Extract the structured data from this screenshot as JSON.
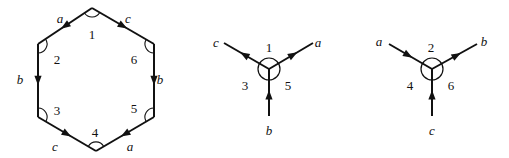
{
  "hexagon": {
    "vertices": [
      {
        "x": 92,
        "y": 8
      },
      {
        "x": 154,
        "y": 44
      },
      {
        "x": 154,
        "y": 117
      },
      {
        "x": 96,
        "y": 151
      },
      {
        "x": 38,
        "y": 117
      },
      {
        "x": 38,
        "y": 44
      }
    ],
    "edges": [
      {
        "from": 0,
        "to": 5,
        "label": "a",
        "label_x": 60,
        "label_y": 20,
        "arrow_t": 0.5
      },
      {
        "from": 0,
        "to": 1,
        "label": "c",
        "label_x": 128,
        "label_y": 20,
        "arrow_t": 0.5
      },
      {
        "from": 5,
        "to": 4,
        "label": "b",
        "label_x": 20,
        "label_y": 81,
        "arrow_t": 0.5
      },
      {
        "from": 1,
        "to": 2,
        "label": "b",
        "label_x": 160,
        "label_y": 81,
        "arrow_t": 0.5
      },
      {
        "from": 4,
        "to": 3,
        "label": "c",
        "label_x": 55,
        "label_y": 148,
        "arrow_t": 0.5
      },
      {
        "from": 2,
        "to": 3,
        "label": "a",
        "label_x": 130,
        "label_y": 148,
        "arrow_t": 0.5
      }
    ],
    "corner_labels": [
      {
        "text": "1",
        "x": 92,
        "y": 36
      },
      {
        "text": "2",
        "x": 57,
        "y": 61
      },
      {
        "text": "3",
        "x": 57,
        "y": 112
      },
      {
        "text": "4",
        "x": 95,
        "y": 134
      },
      {
        "text": "5",
        "x": 134,
        "y": 110
      },
      {
        "text": "6",
        "x": 134,
        "y": 61
      }
    ]
  },
  "vertex_diagrams": [
    {
      "center": {
        "x": 269,
        "y": 69
      },
      "radius": 11,
      "branches": [
        {
          "label": "c",
          "end_x": 224,
          "end_y": 43,
          "direction": "outward",
          "label_x": 216,
          "label_y": 44
        },
        {
          "label": "a",
          "end_x": 313,
          "end_y": 43,
          "direction": "outward",
          "label_x": 318,
          "label_y": 44
        },
        {
          "label": "b",
          "end_x": 269,
          "end_y": 116,
          "direction": "inward",
          "label_x": 269,
          "label_y": 132
        }
      ],
      "sector_labels": [
        {
          "text": "1",
          "x": 269,
          "y": 49
        },
        {
          "text": "3",
          "x": 245,
          "y": 87
        },
        {
          "text": "5",
          "x": 288,
          "y": 87
        }
      ]
    },
    {
      "center": {
        "x": 432,
        "y": 69
      },
      "radius": 11,
      "branches": [
        {
          "label": "a",
          "end_x": 389,
          "end_y": 44,
          "direction": "inward",
          "label_x": 379,
          "label_y": 43
        },
        {
          "label": "b",
          "end_x": 477,
          "end_y": 44,
          "direction": "outward",
          "label_x": 484,
          "label_y": 43
        },
        {
          "label": "c",
          "end_x": 432,
          "end_y": 116,
          "direction": "inward",
          "label_x": 432,
          "label_y": 132
        }
      ],
      "sector_labels": [
        {
          "text": "2",
          "x": 431,
          "y": 49
        },
        {
          "text": "4",
          "x": 410,
          "y": 87
        },
        {
          "text": "6",
          "x": 451,
          "y": 87
        }
      ]
    }
  ]
}
